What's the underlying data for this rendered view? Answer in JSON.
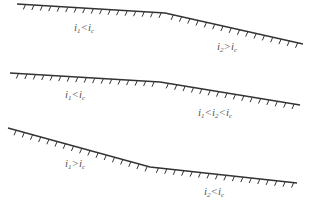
{
  "diagram": {
    "colors": {
      "line": "#333333",
      "label": "#555555",
      "background": "#ffffff"
    },
    "profiles": [
      {
        "id": "profile-1",
        "points": [
          [
            17,
            4
          ],
          [
            165,
            13
          ],
          [
            303,
            44
          ]
        ],
        "labels": [
          {
            "text": "i1<ic",
            "parts": [
              "i",
              "1",
              "<i",
              "c"
            ],
            "x": 74,
            "y": 22
          },
          {
            "text": "i2>ic",
            "parts": [
              "i",
              "2",
              ">i",
              "c"
            ],
            "x": 217,
            "y": 41
          }
        ]
      },
      {
        "id": "profile-2",
        "points": [
          [
            10,
            73
          ],
          [
            160,
            82
          ],
          [
            300,
            105
          ]
        ],
        "labels": [
          {
            "text": "i1<ic",
            "parts": [
              "i",
              "1",
              "<i",
              "c"
            ],
            "x": 65,
            "y": 89
          },
          {
            "text": "i1<i2<ic",
            "parts": [
              "i",
              "1",
              "<i",
              "2",
              "<i",
              "c"
            ],
            "x": 198,
            "y": 107
          }
        ]
      },
      {
        "id": "profile-3",
        "points": [
          [
            8,
            128
          ],
          [
            150,
            167
          ],
          [
            297,
            183
          ]
        ],
        "labels": [
          {
            "text": "i1>ic",
            "parts": [
              "i",
              "1",
              ">i",
              "c"
            ],
            "x": 65,
            "y": 158
          },
          {
            "text": "i2<ic",
            "parts": [
              "i",
              "2",
              "<i",
              "c"
            ],
            "x": 204,
            "y": 186
          }
        ]
      }
    ]
  }
}
